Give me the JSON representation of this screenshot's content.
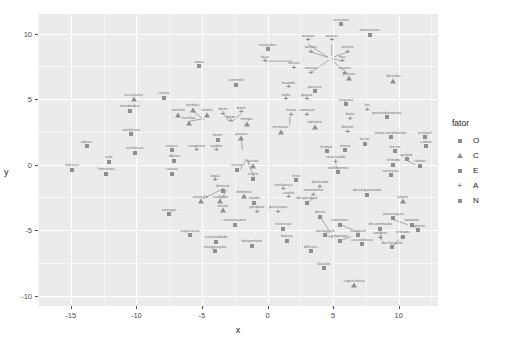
{
  "chart_data": {
    "type": "scatter",
    "title": "",
    "xlabel": "x",
    "ylabel": "y",
    "xlim": [
      -17.5,
      13.0
    ],
    "ylim": [
      -10.8,
      11.5
    ],
    "xticks": [
      "-15",
      "-10",
      "-5",
      "0",
      "5",
      "10"
    ],
    "xtickvals": [
      -15,
      -10,
      -5,
      0,
      5,
      10
    ],
    "yticks": [
      "-10",
      "-5",
      "0",
      "5",
      "10"
    ],
    "ytickvals": [
      -10,
      -5,
      0,
      5,
      10
    ],
    "grid": true,
    "legend": {
      "title": "fator",
      "position": "right",
      "entries": [
        {
          "label": "O",
          "shape": "square"
        },
        {
          "label": "C",
          "shape": "triangle"
        },
        {
          "label": "E",
          "shape": "square"
        },
        {
          "label": "A",
          "shape": "plus"
        },
        {
          "label": "N",
          "shape": "square"
        }
      ]
    },
    "points": [
      {
        "label": "assunto",
        "x": 5.6,
        "y": 10.7,
        "shape": "square"
      },
      {
        "label": "interesses",
        "x": 7.8,
        "y": 9.9,
        "shape": "square"
      },
      {
        "label": "outros",
        "x": 3.1,
        "y": 9.5,
        "shape": "plus"
      },
      {
        "label": "outros",
        "x": 4.9,
        "y": 9.5,
        "shape": "plus"
      },
      {
        "label": "situações",
        "x": 0.0,
        "y": 8.8,
        "shape": "square"
      },
      {
        "label": "outros",
        "x": 3.3,
        "y": 8.6,
        "shape": "plus"
      },
      {
        "label": "outros",
        "x": 6.1,
        "y": 8.6,
        "shape": "plus"
      },
      {
        "label": "faço",
        "x": -0.2,
        "y": 7.9,
        "shape": "plus"
      },
      {
        "label": "fins",
        "x": 5.7,
        "y": 7.9,
        "shape": "plus"
      },
      {
        "label": "vários",
        "x": 2.0,
        "y": 7.4,
        "shape": "plus"
      },
      {
        "label": "outros",
        "x": 3.3,
        "y": 7.0,
        "shape": "plus"
      },
      {
        "label": "outros",
        "x": 5.9,
        "y": 7.0,
        "shape": "plus"
      },
      {
        "label": "ativa",
        "x": -5.2,
        "y": 7.5,
        "shape": "square"
      },
      {
        "label": "planos",
        "x": 6.2,
        "y": 6.6,
        "shape": "triangle"
      },
      {
        "label": "desafio",
        "x": 9.6,
        "y": 6.4,
        "shape": "triangle"
      },
      {
        "label": "controlo",
        "x": -2.4,
        "y": 6.1,
        "shape": "square"
      },
      {
        "label": "mundo",
        "x": 1.6,
        "y": 5.9,
        "shape": "plus"
      },
      {
        "label": "poucos",
        "x": 3.6,
        "y": 5.6,
        "shape": "square"
      },
      {
        "label": "todo",
        "x": 1.4,
        "y": 5.0,
        "shape": "plus"
      },
      {
        "label": "quase",
        "x": 3.0,
        "y": 5.0,
        "shape": "plus"
      },
      {
        "label": "escolares",
        "x": -10.2,
        "y": 5.0,
        "shape": "triangle"
      },
      {
        "label": "rotina",
        "x": -7.9,
        "y": 5.1,
        "shape": "square"
      },
      {
        "label": "original",
        "x": 6.0,
        "y": 4.6,
        "shape": "square"
      },
      {
        "label": "fio",
        "x": 7.6,
        "y": 4.2,
        "shape": "plus"
      },
      {
        "label": "tarefas",
        "x": -5.7,
        "y": 4.2,
        "shape": "triangle"
      },
      {
        "label": "atividades",
        "x": -10.5,
        "y": 4.1,
        "shape": "square"
      },
      {
        "label": "tarefas",
        "x": -6.8,
        "y": 3.8,
        "shape": "triangle"
      },
      {
        "label": "tarefa",
        "x": -4.6,
        "y": 3.8,
        "shape": "triangle"
      },
      {
        "label": "bem",
        "x": -3.4,
        "y": 3.9,
        "shape": "plus"
      },
      {
        "label": "bem",
        "x": -2.0,
        "y": 4.0,
        "shape": "plus"
      },
      {
        "label": "festa",
        "x": 1.8,
        "y": 3.8,
        "shape": "plus"
      },
      {
        "label": "começo",
        "x": 3.0,
        "y": 3.8,
        "shape": "plus"
      },
      {
        "label": "bate",
        "x": 6.3,
        "y": 3.5,
        "shape": "plus"
      },
      {
        "label": "profundamente",
        "x": 9.1,
        "y": 3.6,
        "shape": "square"
      },
      {
        "label": "tarefas",
        "x": -6.0,
        "y": 3.2,
        "shape": "triangle"
      },
      {
        "label": "bem",
        "x": -2.8,
        "y": 3.3,
        "shape": "plus"
      },
      {
        "label": "tempo",
        "x": -1.6,
        "y": 3.1,
        "shape": "triangle"
      },
      {
        "label": "adiante",
        "x": 3.6,
        "y": 2.9,
        "shape": "triangle"
      },
      {
        "label": "terminar",
        "x": 1.0,
        "y": 2.5,
        "shape": "triangle"
      },
      {
        "label": "diante",
        "x": 6.1,
        "y": 2.5,
        "shape": "plus"
      },
      {
        "label": "emocionalmente",
        "x": 9.4,
        "y": 2.1,
        "shape": "square"
      },
      {
        "label": "estável",
        "x": 12.0,
        "y": 2.1,
        "shape": "square"
      },
      {
        "label": "artísticos",
        "x": -10.4,
        "y": 2.3,
        "shape": "square"
      },
      {
        "label": "fazer",
        "x": -3.8,
        "y": 1.9,
        "shape": "square"
      },
      {
        "label": "penso",
        "x": -2.0,
        "y": 2.0,
        "shape": "triangle"
      },
      {
        "label": "triste",
        "x": 7.4,
        "y": 1.6,
        "shape": "square"
      },
      {
        "label": "calma",
        "x": 12.1,
        "y": 1.4,
        "shape": "square"
      },
      {
        "label": "obras",
        "x": -13.8,
        "y": 1.4,
        "shape": "square"
      },
      {
        "label": "novas",
        "x": -7.3,
        "y": 1.1,
        "shape": "square"
      },
      {
        "label": "cooperar",
        "x": -5.4,
        "y": 1.1,
        "shape": "plus"
      },
      {
        "label": "ajudar",
        "x": -3.9,
        "y": 1.1,
        "shape": "plus"
      },
      {
        "label": "humor",
        "x": 4.5,
        "y": 1.0,
        "shape": "square"
      },
      {
        "label": "cheio",
        "x": 5.9,
        "y": 1.1,
        "shape": "square"
      },
      {
        "label": "tenso",
        "x": 9.7,
        "y": 1.0,
        "shape": "square"
      },
      {
        "label": "artísticas",
        "x": -10.1,
        "y": 0.9,
        "shape": "square"
      },
      {
        "label": "arte",
        "x": -12.1,
        "y": 0.2,
        "shape": "square"
      },
      {
        "label": "ideias",
        "x": -7.1,
        "y": 0.3,
        "shape": "square"
      },
      {
        "label": "reservado",
        "x": 5.2,
        "y": 0.2,
        "shape": "plus"
      },
      {
        "label": "irritado",
        "x": 9.6,
        "y": 0.0,
        "shape": "square"
      },
      {
        "label": "quieto",
        "x": 10.6,
        "y": 0.4,
        "shape": "square"
      },
      {
        "label": "calmo",
        "x": 11.6,
        "y": -0.1,
        "shape": "square"
      },
      {
        "label": "música",
        "x": -14.9,
        "y": -0.4,
        "shape": "square"
      },
      {
        "label": "achar",
        "x": -1.1,
        "y": -0.1,
        "shape": "triangle"
      },
      {
        "label": "coisas",
        "x": -2.3,
        "y": -0.4,
        "shape": "square"
      },
      {
        "label": "indiferente",
        "x": 5.4,
        "y": -0.6,
        "shape": "square"
      },
      {
        "label": "nervoso",
        "x": 9.4,
        "y": -0.8,
        "shape": "square"
      },
      {
        "label": "literatura",
        "x": -12.3,
        "y": -0.7,
        "shape": "square"
      },
      {
        "label": "coisas",
        "x": -7.3,
        "y": -0.7,
        "shape": "square"
      },
      {
        "label": "legal",
        "x": -4.0,
        "y": -1.2,
        "shape": "plus"
      },
      {
        "label": "outro",
        "x": -1.1,
        "y": -1.1,
        "shape": "square"
      },
      {
        "label": "leve",
        "x": 2.2,
        "y": -1.2,
        "shape": "square"
      },
      {
        "label": "delicado",
        "x": 4.0,
        "y": -1.7,
        "shape": "plus"
      },
      {
        "label": "brincar",
        "x": -3.4,
        "y": -2.0,
        "shape": "square"
      },
      {
        "label": "confiança",
        "x": 1.2,
        "y": -1.9,
        "shape": "plus"
      },
      {
        "label": "mantenho",
        "x": 3.5,
        "y": -2.3,
        "shape": "plus"
      },
      {
        "label": "desorganizado",
        "x": 7.6,
        "y": -2.3,
        "shape": "square"
      },
      {
        "label": "defeitos",
        "x": -1.8,
        "y": -2.4,
        "shape": "triangle"
      },
      {
        "label": "confio",
        "x": 1.6,
        "y": -2.5,
        "shape": "plus"
      },
      {
        "label": "atenção",
        "x": -5.1,
        "y": -2.8,
        "shape": "triangle"
      },
      {
        "label": "cuidado",
        "x": -3.6,
        "y": -2.8,
        "shape": "triangle"
      },
      {
        "label": "medo",
        "x": -1.0,
        "y": -2.9,
        "shape": "square"
      },
      {
        "label": "desperdiço",
        "x": 3.0,
        "y": -2.9,
        "shape": "square"
      },
      {
        "label": "aluno",
        "x": 10.3,
        "y": -2.8,
        "shape": "triangle"
      },
      {
        "label": "muita",
        "x": -3.4,
        "y": -3.5,
        "shape": "triangle"
      },
      {
        "label": "perdoar",
        "x": -0.8,
        "y": -3.6,
        "shape": "plus"
      },
      {
        "label": "preocupo",
        "x": 0.8,
        "y": -3.6,
        "shape": "plus"
      },
      {
        "label": "energia",
        "x": -7.5,
        "y": -3.8,
        "shape": "square"
      },
      {
        "label": "deixo",
        "x": 4.0,
        "y": -4.0,
        "shape": "square"
      },
      {
        "label": "prossegue",
        "x": 9.6,
        "y": -4.1,
        "shape": "square"
      },
      {
        "label": "tomado",
        "x": 11.0,
        "y": -4.6,
        "shape": "square"
      },
      {
        "label": "entusiasmo",
        "x": -2.5,
        "y": -4.6,
        "shape": "square"
      },
      {
        "label": "estresse",
        "x": 1.2,
        "y": -4.9,
        "shape": "square"
      },
      {
        "label": "inventou",
        "x": 5.5,
        "y": -4.6,
        "shape": "square"
      },
      {
        "label": "desanimado",
        "x": 8.6,
        "y": -4.9,
        "shape": "square"
      },
      {
        "label": "agonia",
        "x": 11.5,
        "y": -5.0,
        "shape": "square"
      },
      {
        "label": "expressar",
        "x": -5.9,
        "y": -5.4,
        "shape": "square"
      },
      {
        "label": "vantagem",
        "x": 4.4,
        "y": -5.4,
        "shape": "square"
      },
      {
        "label": "sociável",
        "x": 6.9,
        "y": -5.4,
        "shape": "square"
      },
      {
        "label": "amável",
        "x": 8.6,
        "y": -5.6,
        "shape": "plus"
      },
      {
        "label": "irritado",
        "x": 10.3,
        "y": -5.5,
        "shape": "square"
      },
      {
        "label": "curiosidade",
        "x": -3.9,
        "y": -5.9,
        "shape": "square"
      },
      {
        "label": "bocas",
        "x": 1.5,
        "y": -5.8,
        "shape": "square"
      },
      {
        "label": "emprego",
        "x": 5.5,
        "y": -5.8,
        "shape": "square"
      },
      {
        "label": "assistência",
        "x": 7.2,
        "y": -6.1,
        "shape": "square"
      },
      {
        "label": "declaração",
        "x": 9.5,
        "y": -6.3,
        "shape": "square"
      },
      {
        "label": "despertam",
        "x": -1.2,
        "y": -6.2,
        "shape": "square"
      },
      {
        "label": "imaginação",
        "x": -4.0,
        "y": -6.6,
        "shape": "square"
      },
      {
        "label": "difíceis",
        "x": 3.3,
        "y": -6.6,
        "shape": "square"
      },
      {
        "label": "falante",
        "x": 4.3,
        "y": -7.9,
        "shape": "square"
      },
      {
        "label": "caprichoso",
        "x": 6.6,
        "y": -9.2,
        "shape": "triangle"
      }
    ],
    "leader_lines": [
      {
        "x1": -0.2,
        "y1": 7.9,
        "x2": 1.9,
        "y2": 7.9
      },
      {
        "x1": 3.1,
        "y1": 9.2,
        "x2": 4.6,
        "y2": 8.2
      },
      {
        "x1": 4.9,
        "y1": 9.2,
        "x2": 4.9,
        "y2": 8.3
      },
      {
        "x1": 6.1,
        "y1": 8.6,
        "x2": 5.0,
        "y2": 8.2
      },
      {
        "x1": 5.7,
        "y1": 7.9,
        "x2": 4.9,
        "y2": 8.1
      },
      {
        "x1": 5.9,
        "y1": 7.1,
        "x2": 4.9,
        "y2": 8.0
      },
      {
        "x1": 3.4,
        "y1": 7.1,
        "x2": 4.7,
        "y2": 8.0
      },
      {
        "x1": 3.3,
        "y1": 8.6,
        "x2": 4.6,
        "y2": 8.2
      },
      {
        "x1": -5.7,
        "y1": 4.1,
        "x2": -4.8,
        "y2": 3.4
      },
      {
        "x1": -6.0,
        "y1": 3.3,
        "x2": -4.9,
        "y2": 3.5
      },
      {
        "x1": -3.4,
        "y1": 3.9,
        "x2": -2.9,
        "y2": 3.3
      },
      {
        "x1": -2.0,
        "y1": 3.9,
        "x2": -2.7,
        "y2": 3.3
      },
      {
        "x1": -2.0,
        "y1": 1.9,
        "x2": -1.9,
        "y2": 1.1
      },
      {
        "x1": 1.7,
        "y1": 3.7,
        "x2": 1.7,
        "y2": 3.0
      },
      {
        "x1": -1.2,
        "y1": -0.2,
        "x2": -1.6,
        "y2": 0.4
      },
      {
        "x1": -1.6,
        "y1": 0.4,
        "x2": -2.1,
        "y2": -0.4
      },
      {
        "x1": -1.6,
        "y1": 0.4,
        "x2": -1.0,
        "y2": -1.0
      },
      {
        "x1": 5.2,
        "y1": 0.1,
        "x2": 5.4,
        "y2": -0.5
      },
      {
        "x1": 10.5,
        "y1": 0.4,
        "x2": 11.4,
        "y2": -0.1
      },
      {
        "x1": -5.1,
        "y1": -2.7,
        "x2": -3.3,
        "y2": -1.8
      },
      {
        "x1": -3.6,
        "y1": -2.7,
        "x2": -3.1,
        "y2": -1.9
      },
      {
        "x1": 3.0,
        "y1": -2.9,
        "x2": 3.6,
        "y2": -2.5
      },
      {
        "x1": 4.1,
        "y1": -4.1,
        "x2": 4.8,
        "y2": -5.2
      },
      {
        "x1": 5.6,
        "y1": -4.6,
        "x2": 7.0,
        "y2": -5.2
      },
      {
        "x1": 4.4,
        "y1": -5.4,
        "x2": 5.1,
        "y2": -5.6
      },
      {
        "x1": 8.6,
        "y1": -4.9,
        "x2": 8.7,
        "y2": -5.8
      },
      {
        "x1": 9.6,
        "y1": -4.2,
        "x2": 10.7,
        "y2": -4.6
      },
      {
        "x1": 9.6,
        "y1": -6.2,
        "x2": 10.2,
        "y2": -5.5
      },
      {
        "x1": 5.6,
        "y1": -5.8,
        "x2": 6.4,
        "y2": -5.5
      }
    ]
  }
}
